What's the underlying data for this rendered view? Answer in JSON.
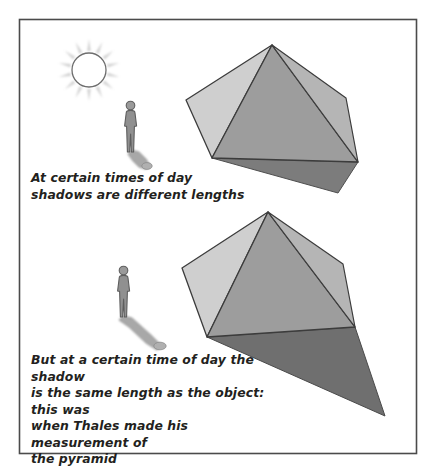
{
  "figure": {
    "name": "thales-pyramid-shadow-illustration",
    "background_color": "#ffffff",
    "frame": {
      "stroke_color": "#4b4b4b",
      "fill_color": "#ffffff",
      "x": 19,
      "y": 19,
      "width": 397,
      "height": 434
    }
  },
  "captions": {
    "top": "At certain times of day\nshadows are different lengths",
    "bottom": "But at a certain time of day the shadow\nis the same length as the object: this was\nwhen Thales made his measurement of\nthe pyramid",
    "text_color": "#231f20"
  },
  "sun": {
    "label": "sun",
    "center_x": 89,
    "center_y": 70,
    "disc_radius": 17,
    "disc_fill": "#ffffff",
    "disc_stroke": "#6e6e6e",
    "ray_count": 14,
    "ray_color": "#b6b6b6",
    "ray_inner_radius": 19,
    "ray_outer_radius": 31
  },
  "scenes": [
    {
      "id": "scene-top",
      "label": "short-shadow-scene",
      "person": {
        "label": "standing-person-short-shadow",
        "x": 128,
        "y": 101,
        "body_fill": "#8c8c8c",
        "body_stroke": "#5e5e5e",
        "shadow_fill": "#a5a5a5",
        "shadow_length": "short"
      },
      "pyramid": {
        "label": "pyramid-short-shadow",
        "apex": [
          272,
          45
        ],
        "left_corner": [
          186,
          100
        ],
        "front_corner": [
          212,
          158
        ],
        "right_corner": [
          358,
          162
        ],
        "shadow_tip": [
          338,
          193
        ],
        "left_face_fill": "#cfcfcf",
        "front_face_fill": "#9d9d9d",
        "right_face_fill": "#b5b5b5",
        "shadow_fill": "#7c7c7c",
        "edge_stroke": "#3c3c3c"
      }
    },
    {
      "id": "scene-bottom",
      "label": "equal-length-shadow-scene",
      "person": {
        "label": "standing-person-long-shadow",
        "x": 121,
        "y": 266,
        "body_fill": "#8c8c8c",
        "body_stroke": "#5e5e5e",
        "shadow_fill": "#a5a5a5",
        "shadow_length": "long"
      },
      "pyramid": {
        "label": "pyramid-long-shadow",
        "apex": [
          268,
          212
        ],
        "left_corner": [
          182,
          268
        ],
        "front_corner": [
          207,
          337
        ],
        "right_corner": [
          355,
          327
        ],
        "shadow_tip": [
          385,
          416
        ],
        "left_face_fill": "#cfcfcf",
        "front_face_fill": "#9d9d9d",
        "right_face_fill": "#b5b5b5",
        "shadow_fill": "#6f6f6f",
        "edge_stroke": "#3c3c3c"
      }
    }
  ]
}
